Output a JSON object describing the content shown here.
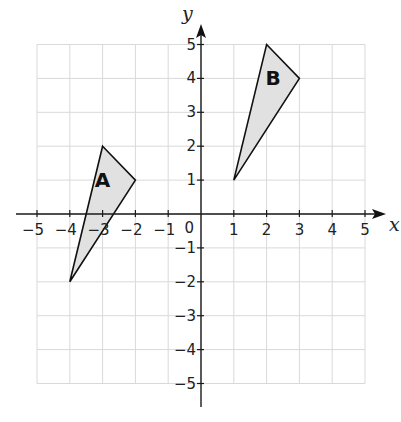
{
  "chart_data": {
    "type": "scatter",
    "title": "",
    "xlabel": "x",
    "ylabel": "y",
    "xlim": [
      -5,
      5
    ],
    "ylim": [
      -5,
      5
    ],
    "grid": true,
    "x_ticks": [
      -5,
      -4,
      -3,
      -2,
      -1,
      1,
      2,
      3,
      4,
      5
    ],
    "y_ticks": [
      -5,
      -4,
      -3,
      -2,
      -1,
      1,
      2,
      3,
      4,
      5
    ],
    "origin_label": "0",
    "shapes": [
      {
        "name": "A",
        "kind": "triangle",
        "vertices": [
          [
            -3,
            2
          ],
          [
            -2,
            1
          ],
          [
            -4,
            -2
          ]
        ],
        "label_position": [
          -3,
          1
        ],
        "fill": "#e1e1e1",
        "stroke": "#111111"
      },
      {
        "name": "B",
        "kind": "triangle",
        "vertices": [
          [
            2,
            5
          ],
          [
            3,
            4
          ],
          [
            1,
            1
          ]
        ],
        "label_position": [
          2.2,
          4
        ],
        "fill": "#e1e1e1",
        "stroke": "#111111"
      }
    ]
  }
}
